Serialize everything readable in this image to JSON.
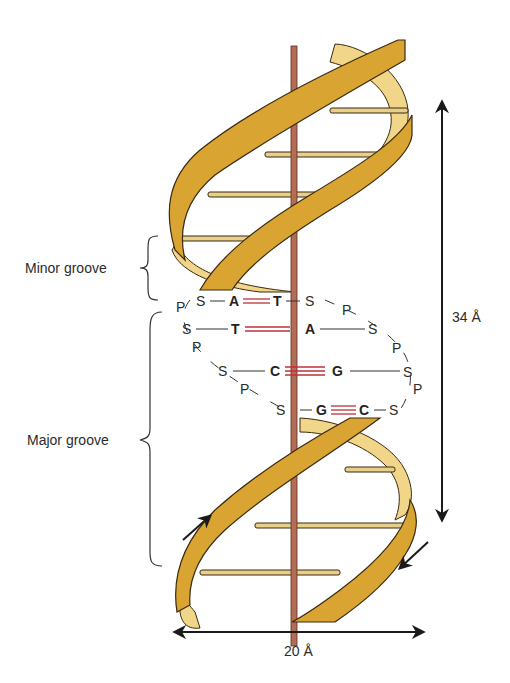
{
  "labels": {
    "minor_groove": "Minor groove",
    "major_groove": "Major groove",
    "pitch": "34 Å",
    "width": "20 Å"
  },
  "base_pairs": [
    {
      "left": "A",
      "right": "T",
      "bonds": 2
    },
    {
      "left": "T",
      "right": "A",
      "bonds": 2
    },
    {
      "left": "C",
      "right": "G",
      "bonds": 3
    },
    {
      "left": "G",
      "right": "C",
      "bonds": 3
    }
  ],
  "backbone": {
    "sugar": "S",
    "phosphate": "P"
  },
  "colors": {
    "ribbon_front": "#d9a431",
    "ribbon_back": "#f1d68a",
    "ribbon_outline": "#3a2a10",
    "axis_rod": "#b56c55",
    "rung": "#e8cf8a",
    "hydrogen_bond": "#c0303a",
    "text": "#2b2b2b"
  }
}
